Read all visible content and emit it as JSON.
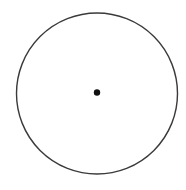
{
  "diagram": {
    "type": "circle-with-center-point",
    "canvas": {
      "width": 186,
      "height": 190,
      "background": "#ffffff"
    },
    "circle": {
      "cx": 97,
      "cy": 93.5,
      "r": 80.5,
      "stroke": "#3a3a3a",
      "stroke_width": 1.4,
      "fill": "none"
    },
    "center_point": {
      "cx": 97,
      "cy": 92.5,
      "r": 3.2,
      "fill": "#111111"
    }
  }
}
